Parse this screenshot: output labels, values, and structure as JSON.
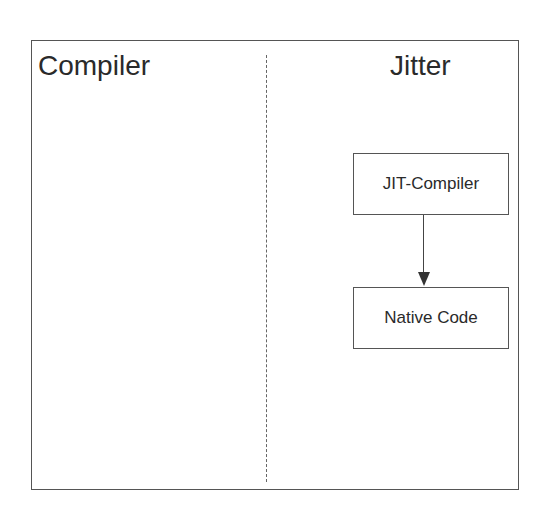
{
  "diagram": {
    "sections": [
      {
        "title": "Compiler"
      },
      {
        "title": "Jitter"
      }
    ],
    "nodes": [
      {
        "id": "jit-compiler",
        "label": "JIT-Compiler"
      },
      {
        "id": "native-code",
        "label": "Native Code"
      }
    ],
    "edges": [
      {
        "from": "jit-compiler",
        "to": "native-code"
      }
    ]
  }
}
